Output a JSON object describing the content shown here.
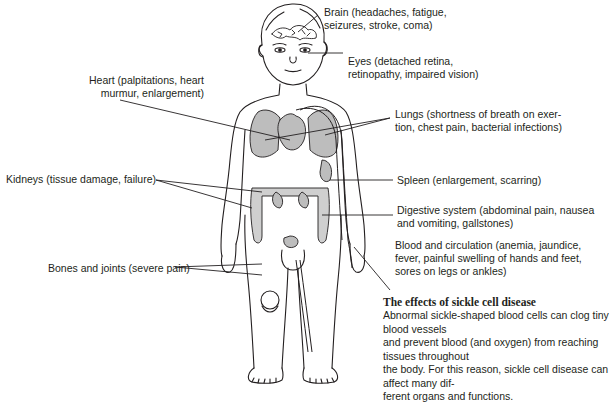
{
  "diagram": {
    "labels": [
      {
        "id": "brain",
        "line1": "Brain (headaches, fatigue,",
        "line2": "seizures, stroke, coma)"
      },
      {
        "id": "eyes",
        "line1": "Eyes (detached retina,",
        "line2": "retinopathy, impaired vision)"
      },
      {
        "id": "heart",
        "line1": "Heart (palpitations, heart",
        "line2": "murmur, enlargement)"
      },
      {
        "id": "lungs",
        "line1": "Lungs (shortness of breath on exer-",
        "line2": "tion, chest pain, bacterial infections)"
      },
      {
        "id": "kidneys",
        "line1": "Kidneys (tissue damage, failure)"
      },
      {
        "id": "spleen",
        "line1": "Spleen (enlargement, scarring)"
      },
      {
        "id": "digestive",
        "line1": "Digestive system (abdominal pain, nausea",
        "line2": "and vomiting, gallstones)"
      },
      {
        "id": "blood",
        "line1": "Blood and circulation (anemia, jaundice,",
        "line2": "fever, painful swelling of hands and feet,",
        "line3": "sores on legs or ankles)"
      },
      {
        "id": "bones",
        "line1": "Bones and joints (severe pain)"
      }
    ],
    "caption": {
      "title": "The effects of sickle cell disease",
      "lines": [
        "Abnormal sickle-shaped blood cells can clog tiny blood vessels",
        "and prevent blood (and oxygen) from reaching tissues throughout",
        "the body. For this reason, sickle cell disease can affect many dif-",
        "ferent organs and functions."
      ]
    },
    "colors": {
      "ink": "#231f20",
      "organ_fill": "#bdbdbd",
      "background": "#ffffff"
    }
  }
}
